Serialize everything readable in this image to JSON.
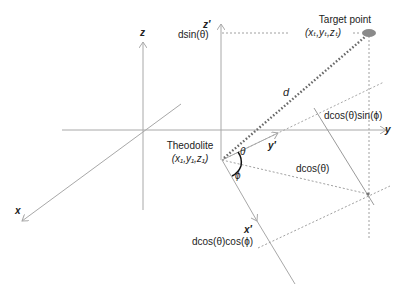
{
  "diagram": {
    "colors": {
      "axis": "#a8a8a8",
      "dashed": "#a0a0a0",
      "dotted_d": "#6a6a6a",
      "target": "#8a8a8a",
      "angle_arc": "#111111",
      "text": "#222222"
    },
    "axes": {
      "z": "z",
      "x": "x",
      "y": "y",
      "z_prime": "z′",
      "y_prime": "y′",
      "x_prime": "x′"
    },
    "labels": {
      "target_point": "Target point",
      "target_coords": "(xₜ,yₜ,zₜ)",
      "theodolite": "Theodolite",
      "theodolite_coords": "(x₁,y₁,z₁)",
      "d": "d",
      "dsin_theta": "dsin(θ)",
      "dcos_theta": "dcos(θ)",
      "dcos_theta_sin_phi": "dcos(θ)sin(ϕ)",
      "dcos_theta_cos_phi": "dcos(θ)cos(ϕ)",
      "theta": "θ",
      "phi": "ϕ"
    }
  }
}
